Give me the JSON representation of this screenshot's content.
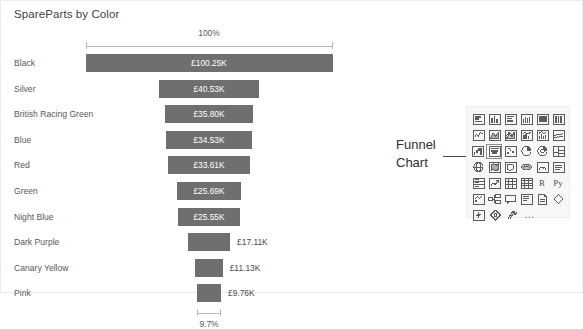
{
  "chart_data": {
    "type": "bar",
    "subtype": "funnel",
    "title": "SpareParts by Color",
    "xlabel": "",
    "ylabel": "",
    "categories": [
      "Black",
      "Silver",
      "British Racing Green",
      "Blue",
      "Red",
      "Green",
      "Night Blue",
      "Dark Purple",
      "Canary Yellow",
      "Pink"
    ],
    "values": [
      100.25,
      40.53,
      35.8,
      34.53,
      33.61,
      25.69,
      25.55,
      17.11,
      11.13,
      9.76
    ],
    "value_labels": [
      "£100.25K",
      "£40.53K",
      "£35.80K",
      "£34.53K",
      "£33.61K",
      "£25.69K",
      "£25.55K",
      "£17.11K",
      "£11.13K",
      "£9.76K"
    ],
    "currency": "£",
    "unit": "K",
    "top_percent_label": "100%",
    "bottom_percent_label": "9.7%",
    "grid": false,
    "legend": "none",
    "bar_color": "#6f6f6f",
    "label_color_inside": "#ffffff",
    "label_color_outside": "#4a4a4a"
  },
  "annotation": {
    "line1": "Funnel",
    "line2": "Chart"
  },
  "viz_panel": {
    "rows": [
      [
        {
          "icon": "stacked-bar-chart-icon"
        },
        {
          "icon": "stacked-column-chart-icon"
        },
        {
          "icon": "clustered-bar-chart-icon"
        },
        {
          "icon": "clustered-column-chart-icon"
        },
        {
          "icon": "hundred-percent-stacked-bar-chart-icon"
        },
        {
          "icon": "hundred-percent-stacked-column-chart-icon"
        }
      ],
      [
        {
          "icon": "line-chart-icon"
        },
        {
          "icon": "area-chart-icon"
        },
        {
          "icon": "stacked-area-chart-icon"
        },
        {
          "icon": "line-and-stacked-column-chart-icon"
        },
        {
          "icon": "line-and-clustered-column-chart-icon"
        },
        {
          "icon": "ribbon-chart-icon"
        }
      ],
      [
        {
          "icon": "waterfall-chart-icon"
        },
        {
          "icon": "funnel-chart-icon",
          "selected": true
        },
        {
          "icon": "scatter-chart-icon"
        },
        {
          "icon": "pie-chart-icon"
        },
        {
          "icon": "donut-chart-icon"
        },
        {
          "icon": "treemap-icon"
        }
      ],
      [
        {
          "icon": "map-icon"
        },
        {
          "icon": "filled-map-icon"
        },
        {
          "icon": "shape-map-icon"
        },
        {
          "icon": "azure-map-icon"
        },
        {
          "icon": "gauge-icon"
        },
        {
          "icon": "card-icon"
        }
      ],
      [
        {
          "icon": "multi-row-card-icon"
        },
        {
          "icon": "kpi-icon"
        },
        {
          "icon": "slicer-icon"
        },
        {
          "icon": "table-icon"
        },
        {
          "icon": "r-script-visual-icon",
          "text": "R"
        },
        {
          "icon": "python-visual-icon",
          "text": "Py"
        }
      ],
      [
        {
          "icon": "key-influencers-icon"
        },
        {
          "icon": "decomposition-tree-icon"
        },
        {
          "icon": "q-and-a-icon"
        },
        {
          "icon": "smart-narrative-icon"
        },
        {
          "icon": "paginated-report-icon"
        },
        {
          "icon": "power-apps-icon"
        }
      ],
      [
        {
          "icon": "power-automate-icon"
        },
        {
          "icon": "arcgis-maps-icon"
        },
        {
          "icon": "scatter-chart-large-icon"
        },
        {
          "icon": "more-options-icon",
          "text": "…"
        }
      ]
    ]
  }
}
